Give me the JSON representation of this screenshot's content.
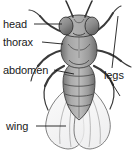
{
  "diagram": {
    "view": "dorsal",
    "background_color": "#ffffff",
    "ink_color": "#1a1a1a",
    "body_fill": "#9a9a9a",
    "wing_fill": "#f2f2f2",
    "labels": [
      {
        "id": "head",
        "text": "head",
        "side": "left",
        "leader": "from text right edge to the head capsule"
      },
      {
        "id": "thorax",
        "text": "thorax",
        "side": "left",
        "leader": "from text right edge to the thorax"
      },
      {
        "id": "abdomen",
        "text": "abdomen",
        "side": "left",
        "leader": "from text right edge to the abdomen"
      },
      {
        "id": "legs",
        "text": "legs",
        "side": "right",
        "leader": "two lines branching to upper and lower right legs"
      },
      {
        "id": "wing",
        "text": "wing",
        "side": "left",
        "leader": "from text right edge to the left wing"
      }
    ],
    "parts": [
      {
        "id": "antennae",
        "count": 2
      },
      {
        "id": "compound-eyes",
        "count": 2
      },
      {
        "id": "head",
        "count": 1
      },
      {
        "id": "thorax",
        "count": 1
      },
      {
        "id": "abdomen",
        "count": 1,
        "segments": 5
      },
      {
        "id": "legs",
        "count": 6
      },
      {
        "id": "wings",
        "count": 2
      }
    ]
  }
}
